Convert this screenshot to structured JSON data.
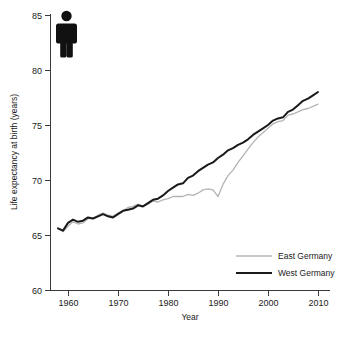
{
  "figure": {
    "background_color": "#ffffff",
    "axis_color": "#3a3a3a",
    "text_color": "#1a1a1a"
  },
  "pictogram": {
    "name": "person-figure-icon",
    "color": "#111111",
    "description": "black standing person pictogram"
  },
  "legend": {
    "position": "bottom-right",
    "entries": [
      {
        "label": "East Germany",
        "color": "#b4b4b4",
        "line_width": 1.3
      },
      {
        "label": "West Germany",
        "color": "#1a1a1a",
        "line_width": 2.0
      }
    ]
  },
  "chart_data": {
    "type": "line",
    "title": "",
    "subtitle": "",
    "xlabel": "Year",
    "ylabel": "Life expectancy at birth (years)",
    "xlim": [
      1956,
      2011
    ],
    "ylim": [
      60,
      85
    ],
    "xticks": [
      1960,
      1970,
      1980,
      1990,
      2000,
      2010
    ],
    "xtick_labels": [
      "1960",
      "1970",
      "1980",
      "1990",
      "2000",
      "2010"
    ],
    "yticks": [
      60,
      65,
      70,
      75,
      80,
      85
    ],
    "ytick_labels": [
      "60",
      "65",
      "70",
      "75",
      "80",
      "85"
    ],
    "grid": false,
    "legend_position": "lower right",
    "x": [
      1958,
      1959,
      1960,
      1961,
      1962,
      1963,
      1964,
      1965,
      1966,
      1967,
      1968,
      1969,
      1970,
      1971,
      1972,
      1973,
      1974,
      1975,
      1976,
      1977,
      1978,
      1979,
      1980,
      1981,
      1982,
      1983,
      1984,
      1985,
      1986,
      1987,
      1988,
      1989,
      1990,
      1991,
      1992,
      1993,
      1994,
      1995,
      1996,
      1997,
      1998,
      1999,
      2000,
      2001,
      2002,
      2003,
      2004,
      2005,
      2006,
      2007,
      2008,
      2009,
      2010
    ],
    "series": [
      {
        "name": "East Germany",
        "color": "#b4b4b4",
        "line_width": 1.3,
        "values": [
          65.6,
          65.3,
          65.8,
          66.2,
          66.0,
          66.1,
          66.5,
          66.5,
          66.8,
          67.0,
          66.8,
          66.7,
          67.0,
          67.2,
          67.5,
          67.6,
          67.8,
          67.6,
          67.8,
          68.1,
          68.0,
          68.2,
          68.3,
          68.5,
          68.5,
          68.5,
          68.7,
          68.6,
          68.8,
          69.1,
          69.2,
          69.1,
          68.5,
          69.6,
          70.4,
          70.9,
          71.6,
          72.2,
          72.8,
          73.4,
          73.9,
          74.3,
          74.7,
          75.1,
          75.3,
          75.4,
          75.9,
          76.0,
          76.2,
          76.4,
          76.5,
          76.7,
          76.9
        ]
      },
      {
        "name": "West Germany",
        "color": "#1a1a1a",
        "line_width": 2.0,
        "values": [
          65.6,
          65.4,
          66.1,
          66.4,
          66.2,
          66.3,
          66.6,
          66.5,
          66.7,
          66.9,
          66.7,
          66.6,
          66.9,
          67.2,
          67.3,
          67.4,
          67.7,
          67.6,
          67.9,
          68.2,
          68.3,
          68.6,
          69.0,
          69.3,
          69.6,
          69.7,
          70.2,
          70.4,
          70.8,
          71.1,
          71.4,
          71.6,
          72.0,
          72.3,
          72.7,
          72.9,
          73.2,
          73.4,
          73.7,
          74.1,
          74.4,
          74.7,
          75.0,
          75.4,
          75.6,
          75.7,
          76.2,
          76.4,
          76.8,
          77.2,
          77.4,
          77.7,
          78.0
        ]
      }
    ]
  }
}
